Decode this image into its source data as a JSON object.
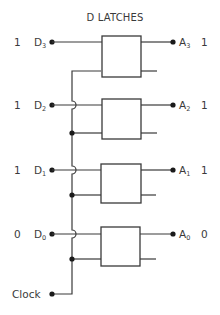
{
  "title": "D LATCHES",
  "clock": {
    "label": "Clock"
  },
  "latches": [
    {
      "input_name": "D",
      "input_sub": "3",
      "input_value": "1",
      "output_name": "A",
      "output_sub": "3",
      "output_value": "1"
    },
    {
      "input_name": "D",
      "input_sub": "2",
      "input_value": "1",
      "output_name": "A",
      "output_sub": "2",
      "output_value": "1"
    },
    {
      "input_name": "D",
      "input_sub": "1",
      "input_value": "1",
      "output_name": "A",
      "output_sub": "1",
      "output_value": "1"
    },
    {
      "input_name": "D",
      "input_sub": "0",
      "input_value": "0",
      "output_name": "A",
      "output_sub": "0",
      "output_value": "0"
    }
  ],
  "colors": {
    "line": "#3a3a3a",
    "background": "#ffffff"
  }
}
